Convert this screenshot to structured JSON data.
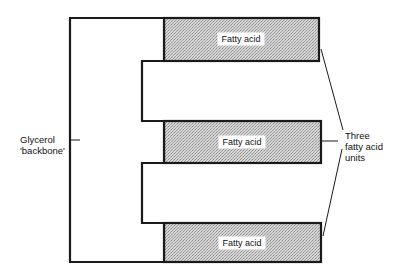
{
  "diagram": {
    "glycerol_label_line1": "Glycerol",
    "glycerol_label_line2": "'backbone'",
    "fatty_acids": [
      {
        "label": "Fatty acid"
      },
      {
        "label": "Fatty acid"
      },
      {
        "label": "Fatty acid"
      }
    ],
    "bracket_label_line1": "Three",
    "bracket_label_line2": "fatty acid",
    "bracket_label_line3": "units",
    "colors": {
      "outline": "#1a1a1a",
      "fatty_acid_fill": "#c9c9c9",
      "background": "#ffffff"
    }
  }
}
